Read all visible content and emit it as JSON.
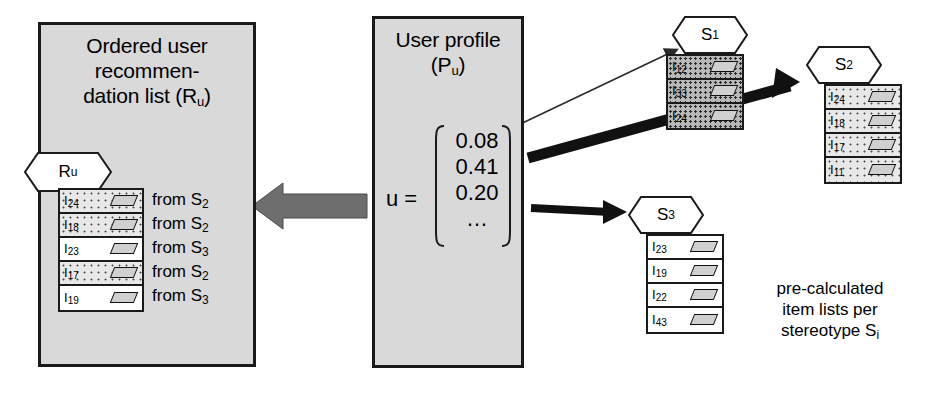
{
  "diagram": {
    "title_recommendation_panel": "Ordered user recommen-dation list (R",
    "caption": {
      "line1": "pre-calculated",
      "line2": "item lists per",
      "line3": "stereotype S",
      "sub": "i"
    }
  },
  "recommendation_panel": {
    "title_lines": [
      "Ordered user",
      "recommen-",
      "dation list (R"
    ],
    "title_sub": "u",
    "title_close": ")",
    "hex_label": "R",
    "hex_sub": "u",
    "items": [
      {
        "label": "I",
        "sub": "24",
        "shading": "dot",
        "from": "from S",
        "from_sub": "2"
      },
      {
        "label": "I",
        "sub": "18",
        "shading": "dot",
        "from": "from S",
        "from_sub": "2"
      },
      {
        "label": "I",
        "sub": "23",
        "shading": "plain",
        "from": "from S",
        "from_sub": "3"
      },
      {
        "label": "I",
        "sub": "17",
        "shading": "dot",
        "from": "from S",
        "from_sub": "2"
      },
      {
        "label": "I",
        "sub": "19",
        "shading": "plain",
        "from": "from S",
        "from_sub": "3"
      }
    ]
  },
  "profile_panel": {
    "title_line1": "User profile",
    "title_line2_open": "(P",
    "title_line2_sub": "u",
    "title_line2_close": ")",
    "equals_label": "u =",
    "vector_values": [
      "0.08",
      "0.41",
      "0.20",
      "…"
    ]
  },
  "stereotypes": [
    {
      "name": "S",
      "sub": "1",
      "shading": "dark",
      "items": [
        {
          "label": "I",
          "sub": "12"
        },
        {
          "label": "I",
          "sub": "33"
        },
        {
          "label": "I",
          "sub": "24"
        }
      ]
    },
    {
      "name": "S",
      "sub": "2",
      "shading": "dot",
      "items": [
        {
          "label": "I",
          "sub": "24"
        },
        {
          "label": "I",
          "sub": "18"
        },
        {
          "label": "I",
          "sub": "17"
        },
        {
          "label": "I",
          "sub": "11"
        }
      ]
    },
    {
      "name": "S",
      "sub": "3",
      "shading": "plain",
      "items": [
        {
          "label": "I",
          "sub": "23"
        },
        {
          "label": "I",
          "sub": "19"
        },
        {
          "label": "I",
          "sub": "22"
        },
        {
          "label": "I",
          "sub": "43"
        }
      ]
    }
  ],
  "colors": {
    "panel_fill": "#d9d9d9",
    "outline": "#1a1a1a",
    "big_arrow": "#6e6e6e",
    "thick_arrow": "#111111"
  }
}
